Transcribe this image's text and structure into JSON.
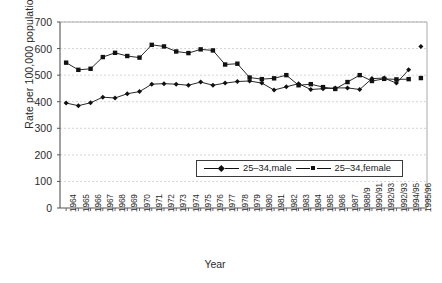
{
  "chart_data": {
    "type": "line",
    "title": "",
    "xlabel": "Year",
    "ylabel": "Rate per 100,000 population",
    "ylim": [
      0,
      700
    ],
    "ytick_step": 100,
    "yticks": [
      "0",
      "100",
      "200",
      "300",
      "400",
      "500",
      "600",
      "700"
    ],
    "grid": "horizontal-dashed",
    "legend_position": "inside-lower-center",
    "categories": [
      "1964",
      "1965",
      "1966",
      "1967",
      "1968",
      "1969",
      "1970",
      "1971",
      "1972",
      "1973",
      "1974",
      "1975",
      "1976",
      "1977",
      "1978",
      "1979",
      "1980",
      "1981",
      "1982",
      "1983",
      "1984",
      "1985",
      "1986",
      "1987",
      "1988/9",
      "1990/91",
      "1992/93",
      "1992/93",
      "1994/95",
      "1995/96"
    ],
    "series": [
      {
        "name": "25–34,male",
        "marker": "diamond",
        "color": "#111111",
        "break_before_last": true,
        "values": [
          395,
          385,
          396,
          417,
          414,
          430,
          438,
          466,
          468,
          466,
          462,
          474,
          462,
          470,
          476,
          478,
          470,
          444,
          456,
          468,
          446,
          449,
          452,
          452,
          446,
          487,
          489,
          470,
          520,
          608
        ]
      },
      {
        "name": "25–34,female",
        "marker": "square",
        "color": "#111111",
        "break_before_last": true,
        "values": [
          547,
          520,
          524,
          568,
          584,
          572,
          566,
          614,
          608,
          589,
          583,
          597,
          593,
          540,
          543,
          491,
          485,
          488,
          500,
          462,
          466,
          455,
          448,
          474,
          500,
          478,
          486,
          484,
          485,
          489
        ]
      }
    ]
  },
  "legend": {
    "items": [
      {
        "label": "25–34,male",
        "marker": "diamond"
      },
      {
        "label": "25–34,female",
        "marker": "square"
      }
    ]
  },
  "axes": {
    "x_title": "Year",
    "y_title": "Rate per 100,000 population"
  }
}
